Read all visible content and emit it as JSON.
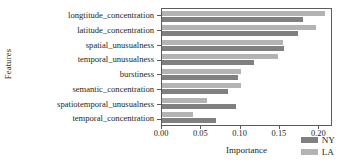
{
  "chart_data": {
    "type": "bar",
    "orientation": "horizontal",
    "title": "",
    "xlabel": "Importance",
    "ylabel": "Features",
    "categories": [
      "longtitude_concentration",
      "latitude_concentration",
      "spatial_unusualness",
      "temporal_unusualness",
      "burstiness",
      "semantic_concentration",
      "spatiotemporal_unusualness",
      "temporal_concentration"
    ],
    "series": [
      {
        "name": "LA",
        "color": "#b3b3b3",
        "values": [
          0.21,
          0.198,
          0.156,
          0.149,
          0.102,
          0.102,
          0.058,
          0.04
        ]
      },
      {
        "name": "NY",
        "color": "#808080",
        "values": [
          0.182,
          0.175,
          0.157,
          0.118,
          0.098,
          0.085,
          0.095,
          0.07
        ]
      }
    ],
    "xlim": [
      0.0,
      0.2175
    ],
    "xticks": [
      0.0,
      0.05,
      0.1,
      0.15,
      0.2
    ],
    "xticklabels": [
      "0.00",
      "0.05",
      "0.10",
      "0.15",
      "0.20"
    ],
    "grid": false,
    "legend_position": "lower right",
    "legend_entries": [
      {
        "label": "NY",
        "color": "#808080"
      },
      {
        "label": "LA",
        "color": "#b3b3b3"
      }
    ]
  }
}
